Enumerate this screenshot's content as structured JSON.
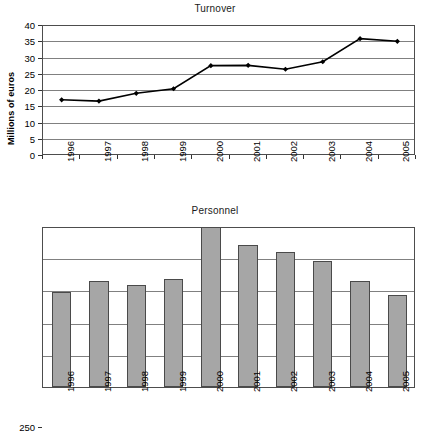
{
  "charts": [
    {
      "title": "Turnover",
      "ylabel": "Millions of euros"
    },
    {
      "title": "Personnel",
      "ylabel": ""
    }
  ],
  "chart_data": [
    {
      "type": "line",
      "title": "Turnover",
      "xlabel": "",
      "ylabel": "Millions of euros",
      "categories": [
        "1996",
        "1997",
        "1998",
        "1999",
        "2000",
        "2001",
        "2002",
        "2003",
        "2004",
        "2005"
      ],
      "values": [
        17.3,
        16.9,
        19.3,
        20.7,
        27.8,
        27.9,
        26.7,
        29.0,
        36.1,
        35.3
      ],
      "ylim": [
        0,
        40
      ],
      "yticks": [
        0,
        5,
        10,
        15,
        20,
        25,
        30,
        35,
        40
      ],
      "grid": true,
      "legend": "none",
      "marker": "diamond",
      "line_color": "#000000"
    },
    {
      "type": "bar",
      "title": "Personnel",
      "xlabel": "",
      "ylabel": "",
      "categories": [
        "1996",
        "1997",
        "1998",
        "1999",
        "2000",
        "2001",
        "2002",
        "2003",
        "2004",
        "2005"
      ],
      "values": [
        148,
        165,
        159,
        167,
        248,
        220,
        209,
        196,
        165,
        143
      ],
      "ylim": [
        0,
        250
      ],
      "yticks": [
        0,
        50,
        100,
        150,
        200,
        250
      ],
      "grid": true,
      "legend": "none",
      "bar_color": "#a6a6a6",
      "bar_edge_color": "#4a4a4a"
    }
  ]
}
